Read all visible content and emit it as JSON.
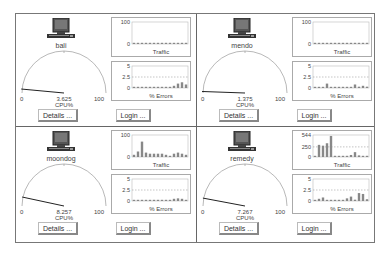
{
  "hosts": [
    {
      "name": "bali",
      "cpu": {
        "value": "3.625",
        "label": "CPU%",
        "min": "0",
        "max": "100",
        "pct": 3.625
      },
      "traffic": {
        "title": "Traffic",
        "ymax_label": "100",
        "ymid_label": "",
        "ymin_label": "0",
        "ymax": 100,
        "values": [
          2,
          2,
          2,
          2,
          2,
          2,
          2,
          2,
          2,
          2,
          2,
          2,
          2,
          2
        ]
      },
      "errors": {
        "title": "% Errors",
        "ymax_label": "5",
        "ymid_label": "2.5",
        "ymin_label": "0",
        "ymax": 5,
        "values": [
          0.2,
          0.2,
          0.2,
          0.2,
          0.2,
          0.2,
          0.2,
          0.2,
          0.2,
          0.2,
          0.5,
          1.0,
          1.3,
          0.8
        ]
      },
      "details_label": "Details ...",
      "login_label": "Login ..."
    },
    {
      "name": "mendo",
      "cpu": {
        "value": "1.375",
        "label": "CPU%",
        "min": "0",
        "max": "100",
        "pct": 1.375
      },
      "traffic": {
        "title": "Traffic",
        "ymax_label": "100",
        "ymid_label": "",
        "ymin_label": "0",
        "ymax": 100,
        "values": [
          2,
          2,
          2,
          2,
          2,
          2,
          2,
          2,
          2,
          2,
          2,
          2,
          2,
          2
        ]
      },
      "errors": {
        "title": "% Errors",
        "ymax_label": "5",
        "ymid_label": "2.5",
        "ymin_label": "0",
        "ymax": 5,
        "values": [
          0.2,
          0.2,
          0.2,
          1.0,
          0.2,
          0.2,
          0.2,
          0.2,
          0.2,
          0.2,
          0.8,
          0.3,
          0.5,
          0.3
        ]
      },
      "details_label": "Details ...",
      "login_label": "Login ..."
    },
    {
      "name": "moondog",
      "cpu": {
        "value": "8.257",
        "label": "CPU%",
        "min": "0",
        "max": "100",
        "pct": 8.257
      },
      "traffic": {
        "title": "Traffic",
        "ymax_label": "100",
        "ymid_label": "",
        "ymin_label": "0",
        "ymax": 100,
        "values": [
          10,
          25,
          70,
          20,
          15,
          15,
          15,
          15,
          10,
          5,
          15,
          20,
          15,
          10
        ]
      },
      "errors": {
        "title": "% Errors",
        "ymax_label": "5",
        "ymid_label": "2.5",
        "ymin_label": "0",
        "ymax": 5,
        "values": [
          0.2,
          0.2,
          0.2,
          0.2,
          0.2,
          0.2,
          0.2,
          0.2,
          0.2,
          0.2,
          0.5,
          0.6,
          0.5,
          0.2
        ]
      },
      "details_label": "Details ...",
      "login_label": "Login ..."
    },
    {
      "name": "remedy",
      "cpu": {
        "value": "7.267",
        "label": "CPU%",
        "min": "0",
        "max": "100",
        "pct": 7.267
      },
      "traffic": {
        "title": "Traffic",
        "ymax_label": "544",
        "ymid_label": "250",
        "ymin_label": "0",
        "ymax": 544,
        "values": [
          20,
          300,
          280,
          340,
          520,
          30,
          20,
          20,
          20,
          50,
          120,
          40,
          20,
          20
        ]
      },
      "errors": {
        "title": "% Errors",
        "ymax_label": "5",
        "ymid_label": "2.5",
        "ymin_label": "0",
        "ymax": 5,
        "values": [
          0.2,
          0.5,
          0.8,
          0.2,
          0.2,
          0.2,
          0.2,
          0.2,
          0.6,
          1.0,
          0.3,
          1.8,
          1.6,
          0.4
        ]
      },
      "details_label": "Details ...",
      "login_label": "Login ..."
    }
  ]
}
